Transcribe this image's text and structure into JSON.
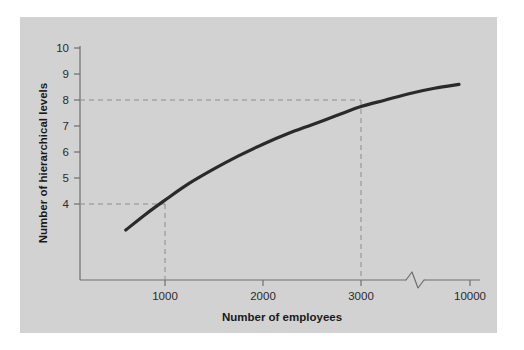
{
  "figure": {
    "panel_color": "#d2d2d2",
    "page_background": "#ffffff"
  },
  "chart_data": {
    "type": "line",
    "title": "",
    "xlabel": "Number of employees",
    "ylabel": "Number of hierarchical levels",
    "xlim": [
      0,
      10000
    ],
    "ylim": [
      0,
      10
    ],
    "grid": false,
    "legend": null,
    "axis_break": {
      "present": true,
      "between": [
        3500,
        9000
      ],
      "note": "zigzag break on x-axis between 3000 tick region and 10000"
    },
    "xticks": [
      {
        "value": 1000,
        "label": "1000"
      },
      {
        "value": 2000,
        "label": "2000"
      },
      {
        "value": 3000,
        "label": "3000"
      },
      {
        "value": 10000,
        "label": "10000"
      }
    ],
    "yticks": [
      {
        "value": 4,
        "label": "4"
      },
      {
        "value": 5,
        "label": "5"
      },
      {
        "value": 6,
        "label": "6"
      },
      {
        "value": 7,
        "label": "7"
      },
      {
        "value": 8,
        "label": "8"
      },
      {
        "value": 9,
        "label": "9"
      },
      {
        "value": 10,
        "label": "10"
      }
    ],
    "series": [
      {
        "name": "hierarchical levels vs employees",
        "color": "#2a2a2a",
        "x": [
          600,
          800,
          1000,
          1250,
          1500,
          1750,
          2000,
          2250,
          2500,
          2750,
          3000,
          3250,
          3500,
          3750,
          4000
        ],
        "y": [
          3.0,
          3.6,
          4.15,
          4.8,
          5.35,
          5.85,
          6.3,
          6.7,
          7.05,
          7.4,
          7.75,
          8.0,
          8.25,
          8.45,
          8.6
        ]
      }
    ],
    "reference_lines": [
      {
        "name": "level-4-at-1000",
        "style": "dashed",
        "color": "#8c8c8c",
        "x": 1000,
        "y": 4
      },
      {
        "name": "level-8-at-3000",
        "style": "dashed",
        "color": "#8c8c8c",
        "x": 3000,
        "y": 8
      }
    ]
  }
}
